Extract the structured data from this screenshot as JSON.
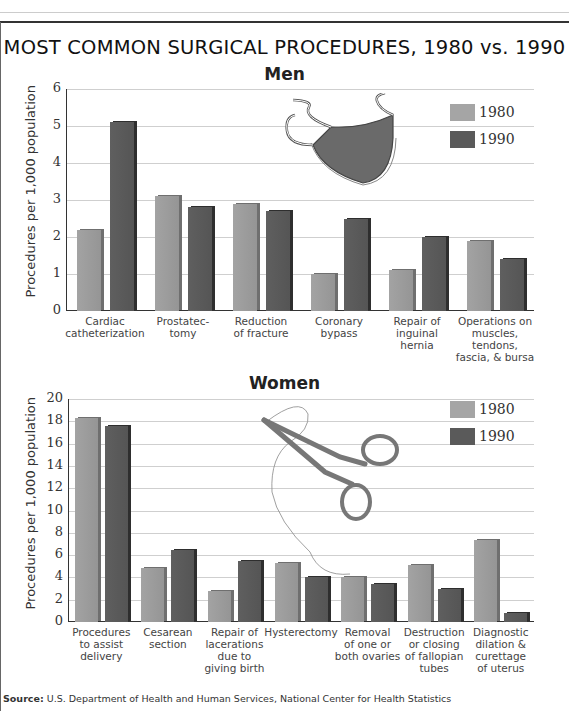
{
  "title": "MOST COMMON SURGICAL PROCEDURES, 1980 vs. 1990",
  "source": {
    "label": "Source:",
    "text": "U.S. Department of Health and Human Services, National Center for Health Statistics"
  },
  "colors": {
    "1980": "#a5a5a5",
    "1990": "#5a5a5a"
  },
  "men": {
    "title": "Men",
    "ylabel": "Procedures per 1,000 population",
    "ticks": [
      "0",
      "1",
      "2",
      "3",
      "4",
      "5",
      "6"
    ],
    "legend": [
      "1980",
      "1990"
    ],
    "illustration": "surgical-mask-icon",
    "categories": [
      "Cardiac\ncatheterization",
      "Prostatec-\ntomy",
      "Reduction\nof fracture",
      "Coronary\nbypass",
      "Repair of\ninguinal\nhernia",
      "Operations on\nmuscles, tendons,\nfascia, & bursa"
    ]
  },
  "women": {
    "title": "Women",
    "ylabel": "Procedures per 1,000 population",
    "ticks": [
      "0",
      "2",
      "4",
      "6",
      "8",
      "10",
      "12",
      "14",
      "16",
      "18",
      "20"
    ],
    "legend": [
      "1980",
      "1990"
    ],
    "illustration": "forceps-icon",
    "categories": [
      "Procedures\nto assist\ndelivery",
      "Cesarean\nsection",
      "Repair of\nlacerations\ndue to\ngiving birth",
      "Hysterectomy",
      "Removal\nof one or\nboth ovaries",
      "Destruction\nor closing\nof fallopian\ntubes",
      "Diagnostic\ndilation &\ncurettage\nof uterus"
    ]
  },
  "chart_data": [
    {
      "type": "bar",
      "title": "Men",
      "suptitle": "MOST COMMON SURGICAL PROCEDURES, 1980 vs. 1990",
      "xlabel": "",
      "ylabel": "Procedures per 1,000 population",
      "ylim": [
        0,
        6
      ],
      "grid": true,
      "legend_position": "upper right",
      "categories": [
        "Cardiac catheterization",
        "Prostatectomy",
        "Reduction of fracture",
        "Coronary bypass",
        "Repair of inguinal hernia",
        "Operations on muscles, tendons, fascia, & bursa"
      ],
      "series": [
        {
          "name": "1980",
          "values": [
            2.2,
            3.1,
            2.9,
            1.0,
            1.1,
            1.9
          ]
        },
        {
          "name": "1990",
          "values": [
            5.1,
            2.8,
            2.7,
            2.5,
            2.0,
            1.4
          ]
        }
      ]
    },
    {
      "type": "bar",
      "title": "Women",
      "xlabel": "",
      "ylabel": "Procedures per 1,000 population",
      "ylim": [
        0,
        20
      ],
      "grid": true,
      "legend_position": "upper right",
      "categories": [
        "Procedures to assist delivery",
        "Cesarean section",
        "Repair of lacerations due to giving birth",
        "Hysterectomy",
        "Removal of one or both ovaries",
        "Destruction or closing of fallopian tubes",
        "Diagnostic dilation & curettage of uterus"
      ],
      "series": [
        {
          "name": "1980",
          "values": [
            18.3,
            4.8,
            2.8,
            5.3,
            4.0,
            5.1,
            7.4
          ]
        },
        {
          "name": "1990",
          "values": [
            17.6,
            6.5,
            5.5,
            4.0,
            3.4,
            3.0,
            0.8
          ]
        }
      ]
    }
  ]
}
